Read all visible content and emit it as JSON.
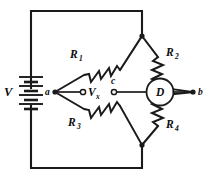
{
  "figure": {
    "kind": "wheatstone-bridge-circuit",
    "background_color": "#ffffff",
    "line_color": "#1a1a1a"
  },
  "source": {
    "label": "V",
    "type": "battery",
    "cell_count": 4
  },
  "resistors": [
    {
      "id": "r1",
      "label": "R",
      "subscript": "1",
      "position": "upper-left"
    },
    {
      "id": "r2",
      "label": "R",
      "subscript": "2",
      "position": "upper-right"
    },
    {
      "id": "r3",
      "label": "R",
      "subscript": "3",
      "position": "lower-left"
    },
    {
      "id": "r4",
      "label": "R",
      "subscript": "4",
      "position": "lower-right"
    }
  ],
  "nodes": [
    {
      "id": "a",
      "label": "a",
      "position": "left-vertex"
    },
    {
      "id": "b",
      "label": "b",
      "position": "right-vertex"
    },
    {
      "id": "c",
      "label": "c",
      "position": "mid-bridge-terminal"
    }
  ],
  "bridge_voltage": {
    "label": "V",
    "subscript": "x"
  },
  "detector": {
    "label": "D",
    "name": "detector"
  }
}
